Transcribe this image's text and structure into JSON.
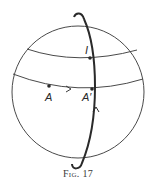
{
  "figure": {
    "caption": "Fig. 17",
    "labels": {
      "point_I": "I",
      "point_A": "A",
      "point_A_prime": "A′"
    },
    "colors": {
      "stroke": "#3a3a3a",
      "bold_stroke": "#2a2a2a",
      "background": "#ffffff"
    }
  }
}
